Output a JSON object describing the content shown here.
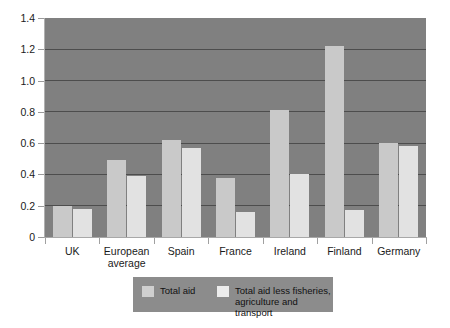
{
  "chart_data": {
    "type": "bar",
    "title": "",
    "subtitle": "",
    "xlabel": "",
    "ylabel": "",
    "ylim": [
      0,
      1.4
    ],
    "ytick_labels": [
      "1.4",
      "1.2",
      "1.0",
      "0.8",
      "0.6",
      "0.4",
      "0.2",
      "0"
    ],
    "ytick_values": [
      1.4,
      1.2,
      1.0,
      0.8,
      0.6,
      0.4,
      0.2,
      0
    ],
    "grid": true,
    "legend_position": "bottom",
    "categories": [
      "UK",
      "European average",
      "Spain",
      "France",
      "Ireland",
      "Finland",
      "Germany"
    ],
    "series": [
      {
        "name": "Total aid",
        "color": "#c9c9c9",
        "values": [
          0.2,
          0.49,
          0.62,
          0.38,
          0.81,
          1.22,
          0.6
        ]
      },
      {
        "name": "Total aid less fisheries, agriculture and transport",
        "color": "#e2e2e2",
        "values": [
          0.18,
          0.39,
          0.57,
          0.16,
          0.4,
          0.17,
          0.58
        ]
      }
    ],
    "annotations": []
  },
  "plot": {
    "background_color": "#808080",
    "gridline_color": "#4d4d4d"
  },
  "legend": {
    "entries": [
      {
        "label": "Total aid",
        "swatch": "legend-swatch-total-aid"
      },
      {
        "label": "Total aid less fisheries,\nagriculture and transport",
        "swatch": "legend-swatch-total-aid-less"
      }
    ]
  }
}
